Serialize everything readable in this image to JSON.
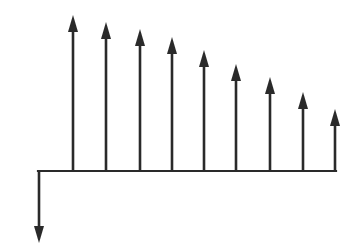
{
  "diagram": {
    "type": "cash-flow-diagram",
    "line_color": "#2a2a2a",
    "background": "#ffffff",
    "baseline": {
      "x_start": 38,
      "x_end": 336,
      "y": 171
    },
    "outflow": {
      "x": 39,
      "y_tip": 243
    },
    "inflows": [
      {
        "x": 73,
        "y_tip": 15
      },
      {
        "x": 106,
        "y_tip": 22
      },
      {
        "x": 140,
        "y_tip": 29
      },
      {
        "x": 172,
        "y_tip": 37
      },
      {
        "x": 204,
        "y_tip": 50
      },
      {
        "x": 236,
        "y_tip": 64
      },
      {
        "x": 270,
        "y_tip": 77
      },
      {
        "x": 303,
        "y_tip": 92
      },
      {
        "x": 335,
        "y_tip": 109
      }
    ]
  }
}
